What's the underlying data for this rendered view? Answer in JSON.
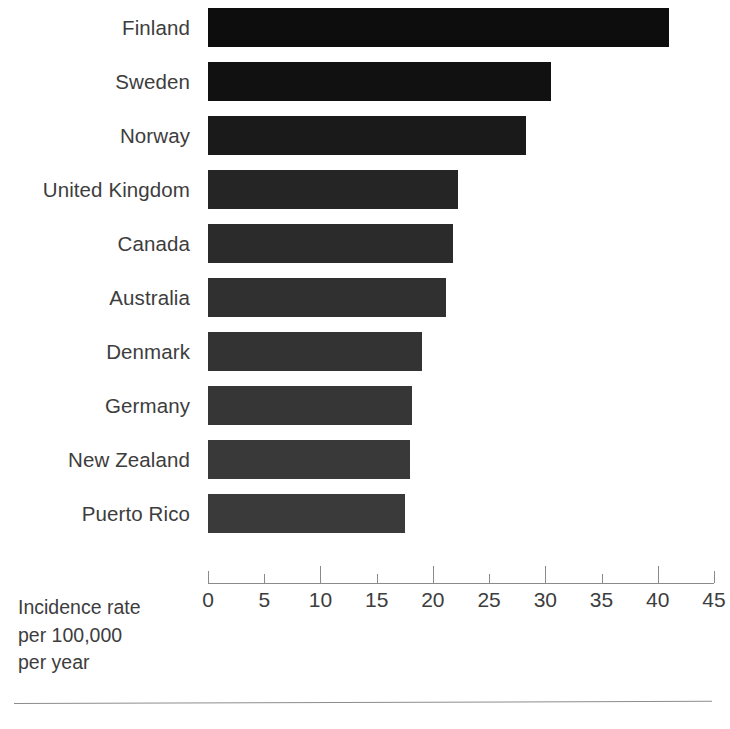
{
  "chart_data": {
    "type": "bar",
    "orientation": "horizontal",
    "title": "",
    "subtitle": "",
    "xlabel": "Incidence rate per 100,000 per year",
    "ylabel": "",
    "xlim": [
      0,
      45
    ],
    "xticks": [
      0,
      5,
      10,
      15,
      20,
      25,
      30,
      35,
      40,
      45
    ],
    "xtick_labels": [
      "0",
      "5",
      "10",
      "15",
      "20",
      "25",
      "30",
      "35",
      "40",
      "45"
    ],
    "grid": false,
    "legend": null,
    "categories": [
      "Finland",
      "Sweden",
      "Norway",
      "United Kingdom",
      "Canada",
      "Australia",
      "Denmark",
      "Germany",
      "New Zealand",
      "Puerto Rico"
    ],
    "values": [
      41.0,
      30.5,
      28.3,
      22.2,
      21.8,
      21.2,
      19.0,
      18.1,
      18.0,
      17.5
    ],
    "bar_colors": [
      "#0d0d0d",
      "#111111",
      "#1a1a1a",
      "#252525",
      "#2b2b2b",
      "#303030",
      "#333333",
      "#363636",
      "#393939",
      "#3a3a3a"
    ]
  },
  "axis_caption": {
    "line1": "Incidence rate",
    "line2": "per 100,000",
    "line3": "per year"
  }
}
